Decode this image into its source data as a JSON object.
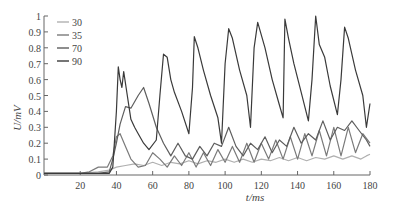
{
  "chart_data": {
    "type": "line",
    "title": "",
    "xlabel": "t/ms",
    "ylabel": "U/mV",
    "xlim": [
      0,
      180
    ],
    "ylim": [
      0,
      1
    ],
    "xticks": [
      20,
      40,
      60,
      80,
      100,
      120,
      140,
      160,
      180
    ],
    "yticks": [
      0,
      0.1,
      0.2,
      0.3,
      0.4,
      0.5,
      0.6,
      0.7,
      0.8,
      0.9,
      1
    ],
    "ytick_labels": [
      "0",
      "0.1",
      "0.2",
      "0.3",
      "0.4",
      "0.5",
      "0.6",
      "0.7",
      "0.8",
      "0.9",
      "1"
    ],
    "grid": false,
    "legend_position": "upper-left",
    "series": [
      {
        "name": "30",
        "color": "#b0b0b0",
        "x": [
          0,
          20,
          30,
          36,
          40,
          45,
          50,
          55,
          60,
          65,
          70,
          75,
          80,
          85,
          90,
          95,
          100,
          105,
          110,
          115,
          120,
          125,
          130,
          135,
          140,
          145,
          150,
          155,
          160,
          165,
          170,
          175,
          178,
          180
        ],
        "y": [
          0.01,
          0.01,
          0.02,
          0.03,
          0.05,
          0.06,
          0.07,
          0.06,
          0.08,
          0.06,
          0.08,
          0.07,
          0.09,
          0.07,
          0.09,
          0.08,
          0.1,
          0.08,
          0.1,
          0.08,
          0.1,
          0.09,
          0.11,
          0.09,
          0.11,
          0.09,
          0.11,
          0.1,
          0.12,
          0.1,
          0.12,
          0.1,
          0.12,
          0.13
        ]
      },
      {
        "name": "35",
        "color": "#7a7a7a",
        "x": [
          0,
          20,
          25,
          30,
          35,
          38,
          40,
          42,
          45,
          48,
          52,
          56,
          60,
          64,
          68,
          72,
          76,
          80,
          84,
          88,
          92,
          96,
          100,
          104,
          108,
          112,
          116,
          120,
          124,
          128,
          132,
          136,
          140,
          144,
          148,
          152,
          156,
          160,
          164,
          168,
          172,
          176,
          180
        ],
        "y": [
          0.01,
          0.01,
          0.02,
          0.05,
          0.05,
          0.12,
          0.24,
          0.26,
          0.18,
          0.1,
          0.05,
          0.06,
          0.14,
          0.1,
          0.05,
          0.12,
          0.06,
          0.14,
          0.05,
          0.14,
          0.06,
          0.16,
          0.08,
          0.18,
          0.08,
          0.2,
          0.08,
          0.2,
          0.1,
          0.22,
          0.1,
          0.24,
          0.1,
          0.26,
          0.12,
          0.28,
          0.12,
          0.3,
          0.12,
          0.3,
          0.14,
          0.26,
          0.2
        ]
      },
      {
        "name": "70",
        "color": "#5e5e5e",
        "x": [
          0,
          30,
          36,
          38,
          40,
          42,
          45,
          48,
          52,
          55,
          58,
          62,
          66,
          70,
          74,
          78,
          82,
          86,
          90,
          94,
          98,
          102,
          106,
          110,
          114,
          118,
          122,
          126,
          130,
          134,
          138,
          142,
          146,
          150,
          154,
          158,
          162,
          166,
          170,
          174,
          178,
          180
        ],
        "y": [
          0.01,
          0.01,
          0.02,
          0.1,
          0.2,
          0.32,
          0.43,
          0.42,
          0.5,
          0.55,
          0.45,
          0.3,
          0.2,
          0.12,
          0.2,
          0.12,
          0.1,
          0.18,
          0.12,
          0.2,
          0.18,
          0.3,
          0.18,
          0.12,
          0.2,
          0.16,
          0.24,
          0.14,
          0.22,
          0.18,
          0.3,
          0.2,
          0.26,
          0.22,
          0.34,
          0.22,
          0.3,
          0.28,
          0.34,
          0.28,
          0.22,
          0.18
        ]
      },
      {
        "name": "90",
        "color": "#3a3a3a",
        "x": [
          0,
          36,
          38,
          40,
          41,
          42,
          43,
          44,
          46,
          48,
          50,
          52,
          55,
          58,
          62,
          64,
          66,
          68,
          70,
          72,
          76,
          80,
          82,
          83,
          85,
          88,
          92,
          96,
          98,
          100,
          102,
          104,
          108,
          112,
          114,
          116,
          118,
          122,
          126,
          130,
          132,
          133,
          135,
          138,
          142,
          146,
          148,
          150,
          152,
          155,
          158,
          162,
          164,
          166,
          168,
          172,
          176,
          178,
          180
        ],
        "y": [
          0.01,
          0.01,
          0.05,
          0.4,
          0.68,
          0.6,
          0.55,
          0.65,
          0.5,
          0.35,
          0.3,
          0.26,
          0.2,
          0.16,
          0.22,
          0.5,
          0.76,
          0.74,
          0.6,
          0.52,
          0.4,
          0.26,
          0.55,
          0.87,
          0.8,
          0.66,
          0.5,
          0.36,
          0.2,
          0.7,
          0.92,
          0.86,
          0.66,
          0.5,
          0.3,
          0.8,
          0.96,
          0.8,
          0.6,
          0.44,
          0.36,
          0.98,
          0.86,
          0.7,
          0.52,
          0.34,
          0.6,
          1.0,
          0.82,
          0.74,
          0.56,
          0.38,
          0.6,
          0.93,
          0.86,
          0.66,
          0.5,
          0.3,
          0.45
        ]
      }
    ]
  }
}
